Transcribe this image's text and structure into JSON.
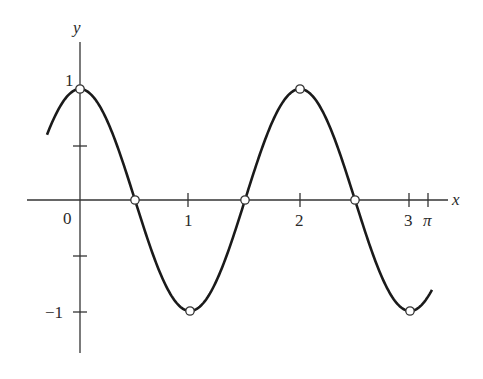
{
  "chart_data": {
    "type": "line",
    "title": "",
    "xlabel": "x",
    "ylabel": "y",
    "function": "y = cos(pi x)",
    "xlim": [
      -0.33,
      3.3
    ],
    "ylim": [
      -1.45,
      1.4
    ],
    "grid": false,
    "x_ticks": [
      {
        "value": 0,
        "label": "0"
      },
      {
        "value": 1,
        "label": "1"
      },
      {
        "value": 2,
        "label": "2"
      },
      {
        "value": 3,
        "label": "3"
      },
      {
        "value": 3.14159,
        "label": "π"
      }
    ],
    "y_ticks": [
      {
        "value": 1,
        "label": "1"
      },
      {
        "value": 0.5,
        "label": ""
      },
      {
        "value": -0.5,
        "label": ""
      },
      {
        "value": -1,
        "label": "−1"
      }
    ],
    "curve_domain": [
      -0.3,
      3.2
    ],
    "marked_points": [
      {
        "x": 0,
        "y": 1
      },
      {
        "x": 0.5,
        "y": 0
      },
      {
        "x": 1,
        "y": -1
      },
      {
        "x": 1.5,
        "y": 0
      },
      {
        "x": 2,
        "y": 1
      },
      {
        "x": 2.5,
        "y": 0
      },
      {
        "x": 3,
        "y": -1
      }
    ],
    "colors": {
      "curve": "#1a1a1a",
      "axes": "#333333",
      "point_fill": "#ffffff"
    }
  },
  "labels": {
    "x_axis": "x",
    "y_axis": "y",
    "origin": "0",
    "x1": "1",
    "x2": "2",
    "x3": "3",
    "xpi": "π",
    "y1": "1",
    "yneg1": "−1"
  }
}
